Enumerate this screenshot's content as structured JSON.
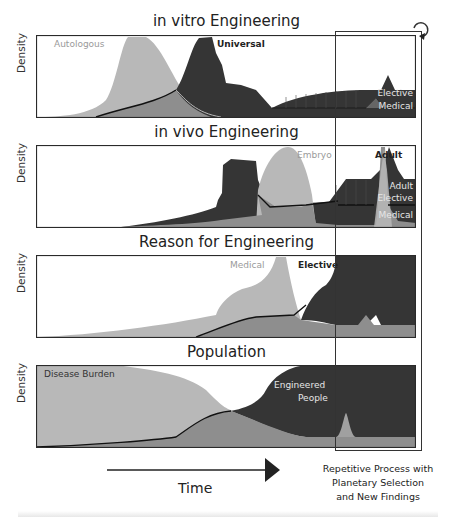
{
  "figure": {
    "panels": [
      {
        "title": "in vitro Engineering",
        "ylabel": "Density",
        "labels": {
          "autologous": "Autologous",
          "universal": "Universal",
          "elective": "Elective",
          "medical": "Medical"
        }
      },
      {
        "title": "in vivo Engineering",
        "ylabel": "Density",
        "labels": {
          "embryo": "Embryo",
          "adult": "Adult",
          "adult_elective_1": "Adult",
          "adult_elective_2": "Elective",
          "medical": "Medical"
        }
      },
      {
        "title": "Reason for Engineering",
        "ylabel": "Density",
        "labels": {
          "medical": "Medical",
          "elective": "Elective"
        }
      },
      {
        "title": "Population",
        "ylabel": "Density",
        "labels": {
          "disease_burden": "Disease Burden",
          "engineered_1": "Engineered",
          "engineered_2": "People"
        }
      }
    ],
    "x_axis_label": "Time",
    "repetitive_box_text": [
      "Repetitive Process with",
      "Planetary Selection",
      "and New Findings"
    ],
    "colors": {
      "light_fill": "#b8b8b8",
      "mid_fill": "#8e8e8e",
      "dark_fill": "#353535",
      "outline": "#2a2a2a"
    }
  }
}
